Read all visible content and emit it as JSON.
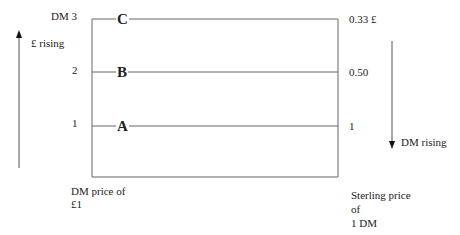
{
  "diagram": {
    "left_axis": {
      "ticks": [
        {
          "label": "DM 3"
        },
        {
          "label": "2"
        },
        {
          "label": "1"
        }
      ],
      "caption_line1": "DM price of",
      "caption_line2": "£1"
    },
    "right_axis": {
      "ticks": [
        {
          "label": "0.33 £"
        },
        {
          "label": "0.50"
        },
        {
          "label": "1"
        }
      ],
      "caption_line1": "Sterling price",
      "caption_line2": "of",
      "caption_line3": "1 DM"
    },
    "points": [
      {
        "label": "C"
      },
      {
        "label": "B"
      },
      {
        "label": "A"
      }
    ],
    "arrows": {
      "left": {
        "label": "£ rising",
        "direction": "up"
      },
      "right": {
        "label": "DM rising",
        "direction": "down"
      }
    },
    "colors": {
      "line": "#666666",
      "text": "#222222"
    }
  }
}
